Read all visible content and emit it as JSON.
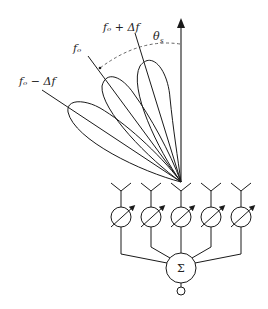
{
  "diagram": {
    "labels": {
      "beam_high": "fₒ + Δf",
      "beam_center": "fₒ",
      "beam_low": "fₒ − Δf",
      "scan_angle": "θ",
      "scan_angle_sub": "s",
      "summer": "Σ"
    },
    "elements": {
      "antenna_count": 5,
      "phase_shifter_count": 5
    },
    "colors": {
      "stroke": "#1a1a1a",
      "dashed": "#555555",
      "background": "#ffffff"
    }
  }
}
